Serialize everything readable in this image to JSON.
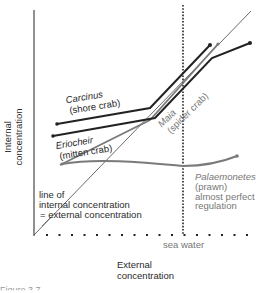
{
  "diagram": {
    "axes": {
      "y_label": [
        "Internal",
        "concentration"
      ],
      "x_label": [
        "External",
        "concentration"
      ],
      "sea_water_label": "sea water"
    },
    "identity_line": {
      "label_lines": [
        "line of",
        "internal concentration",
        "= external concentration"
      ]
    },
    "species": [
      {
        "name": "Carcinus",
        "common": "(shore crab)",
        "color": "#222222"
      },
      {
        "name": "Eriocheir",
        "common": "(mitten crab)",
        "color": "#222222"
      },
      {
        "name": "Maia",
        "common": "(spider crab)",
        "color": "#777777"
      },
      {
        "name": "Palaemonetes",
        "common": "(prawn)",
        "note_lines": [
          "almost perfect",
          "regulation"
        ],
        "color": "#777777"
      }
    ],
    "caption": "Figure 3.7 ..."
  },
  "colors": {
    "axis": "#222222",
    "identity_line": "#444444",
    "grey_series": "#7a7a7a",
    "dark_series": "#222222"
  }
}
